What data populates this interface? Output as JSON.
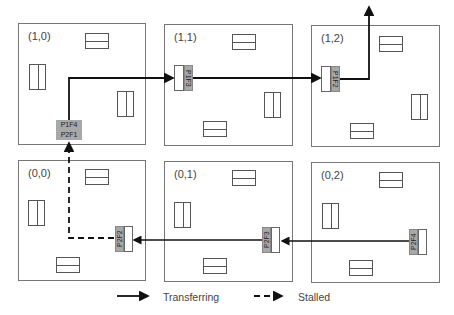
{
  "nodes": [
    {
      "id": "1-0",
      "label": "(1,0)"
    },
    {
      "id": "1-1",
      "label": "(1,1)"
    },
    {
      "id": "1-2",
      "label": "(1,2)"
    },
    {
      "id": "0-0",
      "label": "(0,0)"
    },
    {
      "id": "0-1",
      "label": "(0,1)"
    },
    {
      "id": "0-2",
      "label": "(0,2)"
    }
  ],
  "buffers": {
    "n10_top": "P1F4",
    "n10_bottom": "P2F1",
    "n11": "P1F3",
    "n12": "P1F2",
    "n00": "P2F2",
    "n01": "P2F3",
    "n02": "P2F4"
  },
  "legend": {
    "transferring": "Transferring",
    "stalled": "Stalled"
  },
  "colors": {
    "line": "#111111",
    "buffer_fill": "#a8a8a8",
    "node_border": "#777777"
  }
}
